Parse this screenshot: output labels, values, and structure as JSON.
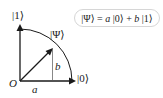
{
  "diagram": {
    "type": "bloch-circle-qubit",
    "axes": {
      "vertical_label": "|1⟩",
      "horizontal_label": "|0⟩",
      "origin_label": "O"
    },
    "vector": {
      "label": "|Ψ⟩",
      "x_component_label": "a",
      "y_component_label": "b"
    },
    "equation": {
      "lhs": "|Ψ⟩",
      "equals": " = ",
      "coef_a": "a",
      "ket0": " |0⟩",
      "plus": " + ",
      "coef_b": "b",
      "ket1": " |1⟩"
    },
    "colors": {
      "ink": "#1a1a1a",
      "box_border": "#d6d6d6"
    }
  }
}
